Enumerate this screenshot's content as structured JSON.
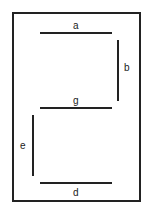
{
  "diagram": {
    "segments": [
      {
        "id": "a",
        "label": "a",
        "orientation": "horizontal"
      },
      {
        "id": "b",
        "label": "b",
        "orientation": "vertical"
      },
      {
        "id": "g",
        "label": "g",
        "orientation": "horizontal"
      },
      {
        "id": "e",
        "label": "e",
        "orientation": "vertical"
      },
      {
        "id": "d",
        "label": "d",
        "orientation": "horizontal"
      }
    ],
    "line_color": "#222222"
  }
}
